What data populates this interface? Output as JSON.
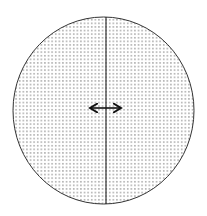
{
  "diagram": {
    "shape": "circle",
    "fill_pattern": "dot-grid",
    "stroke_color": "#333333",
    "dot_color": "#555555",
    "background_color": "#ffffff",
    "divider": "vertical-line",
    "indicator": "double-headed-horizontal-arrow"
  }
}
